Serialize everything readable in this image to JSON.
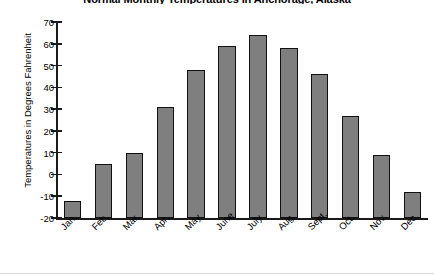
{
  "chart_data": {
    "type": "bar",
    "title": "Normal Monthly Temperatures in Anchorage, Alaska",
    "xlabel": "",
    "ylabel": "Temperatures in Degrees Fahrenheit",
    "categories": [
      "Jan.",
      "Feb.",
      "Mar.",
      "Apr.",
      "May",
      "June",
      "July",
      "Aug.",
      "Sept.",
      "Oct.",
      "Nov.",
      "Dec."
    ],
    "values": [
      -12,
      5,
      10,
      31,
      48,
      59,
      64,
      58,
      46,
      27,
      9,
      -8
    ],
    "ylim": [
      -20,
      70
    ],
    "ytick_labels": [
      "70",
      "60",
      "50",
      "40",
      "30",
      "20",
      "10",
      "0",
      "-10",
      "-20"
    ],
    "ytick_values": [
      70,
      60,
      50,
      40,
      30,
      20,
      10,
      0,
      -10,
      -20
    ],
    "ytick_step": 10,
    "grid": false,
    "legend": null,
    "series_color": "#7f7f7f",
    "border_color": "#111111",
    "axis_color": "#1a1a1a"
  }
}
